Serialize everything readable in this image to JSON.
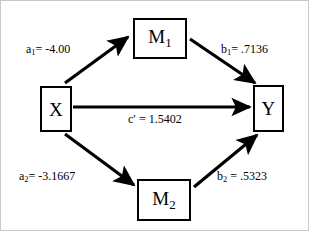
{
  "diagram": {
    "type": "parallel-multiple-mediator-path-model",
    "nodes": [
      {
        "id": "x",
        "label": "X",
        "subscript": "",
        "role": "independent-variable"
      },
      {
        "id": "m1",
        "label": "M",
        "subscript": "1",
        "role": "mediator"
      },
      {
        "id": "m2",
        "label": "M",
        "subscript": "2",
        "role": "mediator"
      },
      {
        "id": "y",
        "label": "Y",
        "subscript": "",
        "role": "dependent-variable"
      }
    ],
    "paths": [
      {
        "id": "a1",
        "from": "x",
        "to": "m1",
        "coefficient_name": "a",
        "coefficient_subscript": "1",
        "value": "-4.00",
        "text": "a₁= -4.00"
      },
      {
        "id": "b1",
        "from": "m1",
        "to": "y",
        "coefficient_name": "b",
        "coefficient_subscript": "1",
        "value": ".7136",
        "text": "b₁= .7136"
      },
      {
        "id": "c_prime",
        "from": "x",
        "to": "y",
        "coefficient_name": "c′",
        "coefficient_subscript": "",
        "value": "1.5402",
        "text": "c′ = 1.5402"
      },
      {
        "id": "a2",
        "from": "x",
        "to": "m2",
        "coefficient_name": "a",
        "coefficient_subscript": "2",
        "value": "-3.1667",
        "text": "a₂= -3.1667"
      },
      {
        "id": "b2",
        "from": "m2",
        "to": "y",
        "coefficient_name": "b",
        "coefficient_subscript": "2",
        "value": ".5323",
        "text": "b₂ = .5323"
      }
    ],
    "colors": {
      "stroke": "#000000",
      "background": "#ffffff",
      "frame": "#c8c8c8"
    }
  },
  "node_labels": {
    "x": "X",
    "y": "Y",
    "m1_base": "M",
    "m1_sub": "1",
    "m2_base": "M",
    "m2_sub": "2"
  },
  "path_labels": {
    "a1_base": "a",
    "a1_sub": "1",
    "a1_rest": "= -4.00",
    "b1_base": "b",
    "b1_sub": "1",
    "b1_rest": "= .7136",
    "c_base": "c′",
    "c_rest": "= 1.5402",
    "a2_base": "a",
    "a2_sub": "2",
    "a2_rest": "= -3.1667",
    "b2_base": "b",
    "b2_sub": "2",
    "b2_rest": "= .5323"
  }
}
